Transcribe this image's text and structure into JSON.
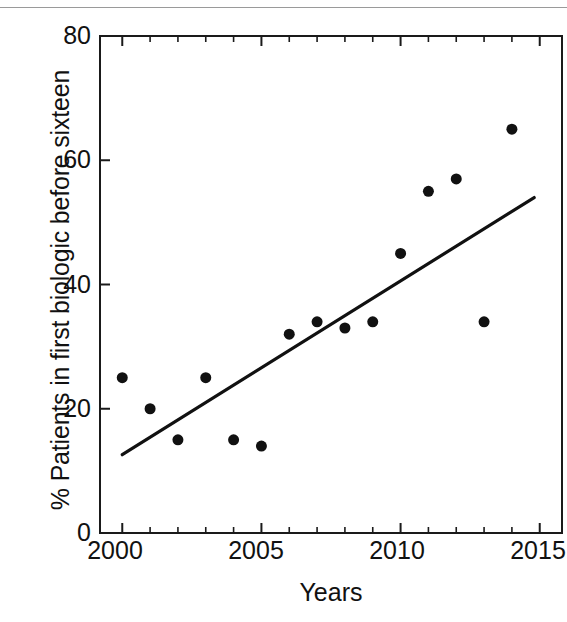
{
  "chart_data": {
    "type": "scatter",
    "title": "",
    "xlabel": "Years",
    "ylabel": "% Patients in first biologic before sixteen",
    "xlim": [
      1999.2,
      2015.8
    ],
    "ylim": [
      0,
      80
    ],
    "grid": false,
    "legend": null,
    "x_ticks": [
      2000,
      2005,
      2010,
      2015
    ],
    "x_minor_tick_interval": 1,
    "y_ticks": [
      0,
      20,
      40,
      60,
      80
    ],
    "x_tick_labels": [
      "2000",
      "2005",
      "2010",
      "2015"
    ],
    "y_tick_labels": [
      "0",
      "20",
      "40",
      "60",
      "80"
    ],
    "marker": {
      "shape": "circle",
      "color": "#111111",
      "size_px": 11
    },
    "series": [
      {
        "name": "% Patients in first biologic before sixteen",
        "type": "scatter",
        "x": [
          2000,
          2001,
          2002,
          2003,
          2004,
          2005,
          2006,
          2007,
          2008,
          2009,
          2010,
          2011,
          2012,
          2013,
          2014
        ],
        "values": [
          25,
          20,
          15,
          25,
          15,
          14,
          32,
          34,
          33,
          34,
          45,
          55,
          57,
          34,
          65
        ]
      },
      {
        "name": "trend line",
        "type": "line",
        "color": "#111111",
        "x": [
          2000,
          2014.8
        ],
        "values": [
          12.6,
          54
        ]
      }
    ]
  },
  "axes": {
    "y_label": "% Patients in first biologic before sixteen",
    "x_label": "Years",
    "y_tick_labels": [
      "80",
      "60",
      "40",
      "20",
      "0"
    ],
    "y_tick_values": [
      80,
      60,
      40,
      20,
      0
    ],
    "x_tick_labels": [
      "2000",
      "2005",
      "2010",
      "2015"
    ],
    "x_tick_values": [
      2000,
      2005,
      2010,
      2015
    ]
  }
}
